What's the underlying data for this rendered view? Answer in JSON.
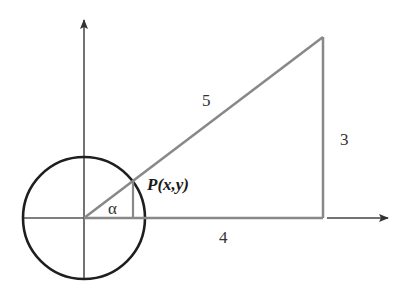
{
  "diagram": {
    "colors": {
      "background": "#ffffff",
      "axis": "#555555",
      "circle": "#1e1e1e",
      "triangle": "#888888",
      "text": "#222222"
    },
    "labels": {
      "hypotenuse": "5",
      "vertical_leg": "3",
      "horizontal_leg": "4",
      "angle": "α",
      "point": "P(x,y)"
    },
    "geometry": {
      "origin": [
        84,
        218
      ],
      "unit_radius_px": 61,
      "triangle_legs": {
        "adjacent": 4,
        "opposite": 3,
        "hypotenuse": 5
      },
      "scale_px_per_unit": 59.75
    },
    "axes": {
      "x_axis": {
        "from": [
          24,
          218
        ],
        "to": [
          390,
          218
        ],
        "arrow": true
      },
      "y_axis": {
        "from": [
          84,
          279
        ],
        "to": [
          84,
          18
        ],
        "arrow": true
      }
    }
  }
}
